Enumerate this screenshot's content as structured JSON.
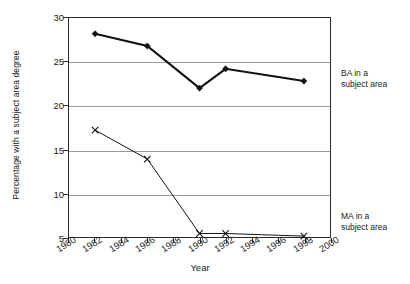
{
  "chart_data": {
    "type": "line",
    "title": "",
    "xlabel": "Year",
    "ylabel": "Percentage with a subject area degree",
    "xlim": [
      1980,
      2000
    ],
    "ylim": [
      5,
      30
    ],
    "ytick_step": 5,
    "xtick_step": 2,
    "grid": "horizontal",
    "gridlines_at": [
      10,
      15,
      20,
      25
    ],
    "legend_position": "right-outside",
    "xticks": [
      "1980",
      "1982",
      "1984",
      "1986",
      "1988",
      "1990",
      "1992",
      "1994",
      "1996",
      "1998",
      "2000"
    ],
    "yticks": [
      "5",
      "10",
      "15",
      "20",
      "25",
      "30"
    ],
    "series": [
      {
        "name": "BA in a subject area",
        "legend_line1": "BA in a",
        "legend_line2": "subject area",
        "marker": "diamond",
        "color": "#111111",
        "line_width": 2.1,
        "x": [
          1982,
          1986,
          1990,
          1992,
          1998
        ],
        "values": [
          28.2,
          26.8,
          22.0,
          24.2,
          22.8
        ]
      },
      {
        "name": "MA in a subject area",
        "legend_line1": "MA in a",
        "legend_line2": "subject area",
        "marker": "x",
        "color": "#111111",
        "line_width": 1.0,
        "x": [
          1982,
          1986,
          1990,
          1992,
          1998
        ],
        "values": [
          17.2,
          13.9,
          5.4,
          5.4,
          5.1
        ]
      }
    ]
  },
  "axes": {
    "y_title": "Percentage with a subject area degree",
    "x_title": "Year"
  },
  "colors": {
    "frame": "#2b2b2b",
    "gridline": "#9a9a9a",
    "text": "#1a1a1a",
    "background": "#ffffff",
    "series": "#111111"
  }
}
